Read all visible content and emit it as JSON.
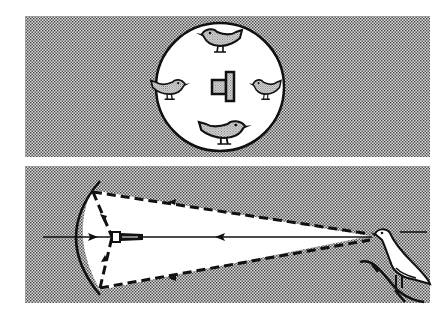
{
  "figure": {
    "panels": [
      {
        "name": "top-panel",
        "description": "Circular disk with a central microphone surrounded by four birds",
        "elements": [
          "disk",
          "microphone",
          "bird-top",
          "bird-left",
          "bird-right",
          "bird-bottom"
        ]
      },
      {
        "name": "bottom-panel",
        "description": "Parabolic reflector focusing sound from a singing bird on a branch onto a microphone at the focal point",
        "elements": [
          "parabolic-reflector",
          "microphone",
          "sound-rays",
          "bird-on-branch"
        ]
      }
    ],
    "colors": {
      "background": "#ffffff",
      "stipple_dark": "#555555",
      "stroke": "#111111"
    }
  }
}
